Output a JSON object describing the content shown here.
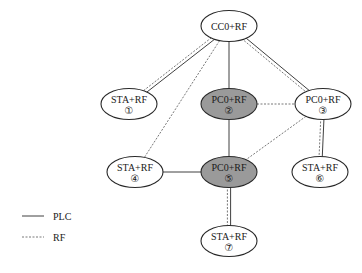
{
  "diagram": {
    "type": "network-topology",
    "nodes": [
      {
        "id": "cc0",
        "label": "CC0+RF",
        "number": "",
        "role": "central-coordinator",
        "highlighted": false
      },
      {
        "id": "n1",
        "label": "STA+RF",
        "number": "①",
        "role": "station",
        "highlighted": false
      },
      {
        "id": "n2",
        "label": "PC0+RF",
        "number": "②",
        "role": "proxy-coordinator",
        "highlighted": true
      },
      {
        "id": "n3",
        "label": "PC0+RF",
        "number": "③",
        "role": "proxy-coordinator",
        "highlighted": false
      },
      {
        "id": "n4",
        "label": "STA+RF",
        "number": "④",
        "role": "station",
        "highlighted": false
      },
      {
        "id": "n5",
        "label": "PC0+RF",
        "number": "⑤",
        "role": "proxy-coordinator",
        "highlighted": true
      },
      {
        "id": "n6",
        "label": "STA+RF",
        "number": "⑥",
        "role": "station",
        "highlighted": false
      },
      {
        "id": "n7",
        "label": "STA+RF",
        "number": "⑦",
        "role": "station",
        "highlighted": false
      }
    ],
    "edges": [
      {
        "from": "cc0",
        "to": "n1",
        "links": [
          "PLC",
          "RF"
        ]
      },
      {
        "from": "cc0",
        "to": "n4",
        "links": [
          "RF"
        ]
      },
      {
        "from": "cc0",
        "to": "n2",
        "links": [
          "PLC"
        ]
      },
      {
        "from": "cc0",
        "to": "n3",
        "links": [
          "PLC",
          "RF"
        ]
      },
      {
        "from": "n2",
        "to": "n3",
        "links": [
          "RF"
        ]
      },
      {
        "from": "n2",
        "to": "n5",
        "links": [
          "PLC"
        ]
      },
      {
        "from": "n3",
        "to": "n5",
        "links": [
          "RF"
        ]
      },
      {
        "from": "n3",
        "to": "n6",
        "links": [
          "PLC",
          "RF"
        ]
      },
      {
        "from": "n4",
        "to": "n5",
        "links": [
          "PLC"
        ]
      },
      {
        "from": "n5",
        "to": "n7",
        "links": [
          "PLC",
          "RF"
        ]
      }
    ]
  },
  "legend": {
    "items": [
      {
        "key": "PLC",
        "label": "PLC",
        "style": "solid"
      },
      {
        "key": "RF",
        "label": "RF",
        "style": "dashed"
      }
    ]
  },
  "colors": {
    "highlight_fill": "#9a9a9a",
    "node_fill": "#ffffff",
    "stroke": "#2a2a2a",
    "rf_stroke": "#555555"
  }
}
